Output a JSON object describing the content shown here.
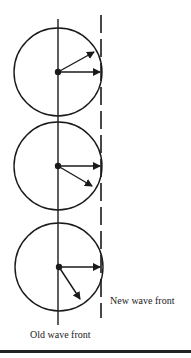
{
  "labels": {
    "new_wave_front": "New wave front",
    "old_wave_front": "Old wave front"
  },
  "diagram": {
    "type": "Huygens wavelets",
    "wavelets": 3,
    "stroke_color": "#1a1a1a"
  }
}
